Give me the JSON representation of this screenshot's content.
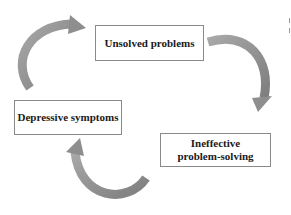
{
  "diagram": {
    "type": "cycle",
    "nodes": [
      {
        "id": "unsolved",
        "label": "Unsolved problems"
      },
      {
        "id": "ineffective",
        "label": "Ineffective problem-solving"
      },
      {
        "id": "depressive",
        "label": "Depressive symptoms"
      }
    ],
    "edges": [
      {
        "from": "unsolved",
        "to": "ineffective"
      },
      {
        "from": "ineffective",
        "to": "depressive"
      },
      {
        "from": "depressive",
        "to": "unsolved"
      }
    ],
    "arrow_color": "#8e8e8e"
  }
}
